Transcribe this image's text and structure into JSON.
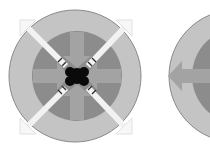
{
  "icons": [
    {
      "name": "converge-expand-icon",
      "description": "circle with diagonal outward arrows and inward cross arrows"
    },
    {
      "name": "arrow-left-circle-icon",
      "description": "partial circle with left-pointing arrow"
    }
  ],
  "colors": {
    "outer_ring": "#c4c4c4",
    "outer_ring_stroke": "#8a8a8a",
    "inner_disc": "#8c8c8c",
    "cross_arrows": "#a3a3a3",
    "diagonal_arrows": "#f2f2f2",
    "center": "#0a0a0a",
    "background": "#ffffff"
  }
}
